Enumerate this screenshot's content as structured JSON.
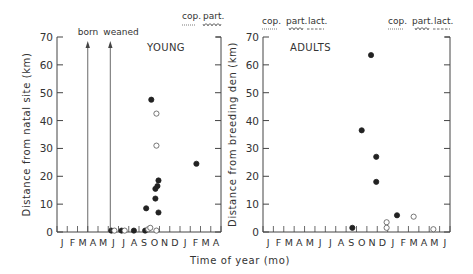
{
  "chart_data": [
    {
      "type": "scatter",
      "title": "YOUNG",
      "xlabel": "Time of year (mo)",
      "ylabel": "Distance from natal site (km)",
      "ylim": [
        0,
        70
      ],
      "yticks": [
        0,
        10,
        20,
        30,
        40,
        50,
        60,
        70
      ],
      "xtick_labels": [
        "J",
        "F",
        "M",
        "A",
        "M",
        "J",
        "J",
        "A",
        "S",
        "O",
        "N",
        "D",
        "J",
        "F",
        "M",
        "A"
      ],
      "grid": false,
      "annotations": [
        {
          "text": "born",
          "x_month_index": 3.0
        },
        {
          "text": "weaned",
          "x_month_index": 5.2
        }
      ],
      "legend": [
        {
          "label": "cop.",
          "style": "dotted"
        },
        {
          "label": "part.",
          "style": "zigzag"
        }
      ],
      "series": [
        {
          "name": "filled",
          "marker": "filled-circle",
          "points": [
            [
              5.3,
              0.5
            ],
            [
              6.3,
              0.5
            ],
            [
              7.5,
              0.5
            ],
            [
              8.6,
              0.5
            ],
            [
              8.7,
              8.5
            ],
            [
              9.2,
              47.5
            ],
            [
              9.6,
              12
            ],
            [
              9.6,
              15.5
            ],
            [
              9.8,
              16.5
            ],
            [
              9.9,
              18.5
            ],
            [
              9.9,
              7
            ],
            [
              13.6,
              24.5
            ]
          ]
        },
        {
          "name": "open",
          "marker": "open-circle",
          "points": [
            [
              5.6,
              0.5
            ],
            [
              6.6,
              0.5
            ],
            [
              8.9,
              1
            ],
            [
              9.1,
              1.5
            ],
            [
              9.7,
              0.5
            ],
            [
              9.7,
              42.5
            ],
            [
              9.7,
              31
            ]
          ]
        }
      ]
    },
    {
      "type": "scatter",
      "title": "ADULTS",
      "xlabel": "Time of year (mo)",
      "ylabel": "Distance from breeding den (km)",
      "ylim": [
        0,
        70
      ],
      "yticks": [
        0,
        10,
        20,
        30,
        40,
        50,
        60,
        70
      ],
      "xtick_labels": [
        "J",
        "F",
        "M",
        "A",
        "M",
        "J",
        "J",
        "A",
        "S",
        "O",
        "N",
        "D",
        "J",
        "F",
        "M",
        "A",
        "M",
        "J"
      ],
      "grid": false,
      "legend_left": [
        {
          "label": "cop.",
          "style": "dotted"
        },
        {
          "label": "part.",
          "style": "zigzag"
        },
        {
          "label": "lact.",
          "style": "dashed"
        }
      ],
      "legend_right": [
        {
          "label": "cop.",
          "style": "dotted"
        },
        {
          "label": "part.",
          "style": "zigzag"
        },
        {
          "label": "lact.",
          "style": "dashed"
        }
      ],
      "series": [
        {
          "name": "filled",
          "marker": "filled-circle",
          "points": [
            [
              8.6,
              1.5
            ],
            [
              9.5,
              36.5
            ],
            [
              10.4,
              63.5
            ],
            [
              10.9,
              27
            ],
            [
              10.9,
              18
            ],
            [
              12.9,
              6
            ]
          ]
        },
        {
          "name": "open",
          "marker": "open-circle",
          "points": [
            [
              11.9,
              3.5
            ],
            [
              11.9,
              1.5
            ],
            [
              14.5,
              5.5
            ],
            [
              16.4,
              1
            ]
          ]
        }
      ]
    }
  ],
  "labels": {
    "shared_xlabel": "Time of year (mo)",
    "left_title": "YOUNG",
    "right_title": "ADULTS",
    "born": "born",
    "weaned": "weaned",
    "cop": "cop.",
    "part": "part.",
    "lact": "lact.",
    "left_ylabel": "Distance from natal site (km)",
    "right_ylabel": "Distance from breeding den (km)"
  }
}
